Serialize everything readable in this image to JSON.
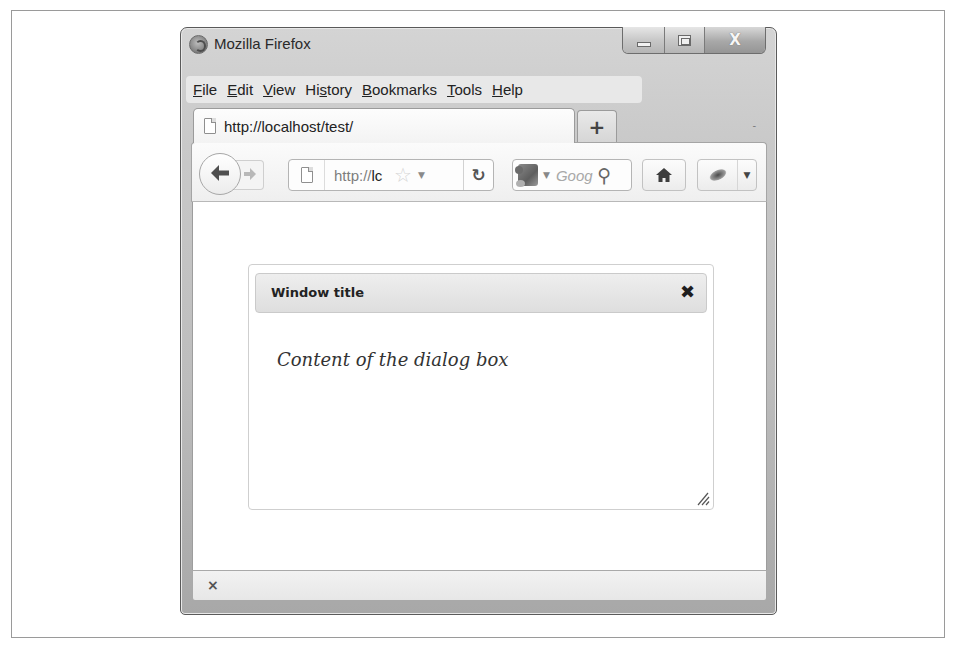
{
  "window": {
    "title": "Mozilla Firefox",
    "controls": {
      "minimize": "minimize",
      "maximize": "maximize",
      "close": "X"
    }
  },
  "menubar": {
    "items": [
      {
        "label": "File",
        "accesskey_index": 0
      },
      {
        "label": "Edit",
        "accesskey_index": 0
      },
      {
        "label": "View",
        "accesskey_index": 0
      },
      {
        "label": "History",
        "accesskey_index": 2
      },
      {
        "label": "Bookmarks",
        "accesskey_index": 0
      },
      {
        "label": "Tools",
        "accesskey_index": 0
      },
      {
        "label": "Help",
        "accesskey_index": 0
      }
    ]
  },
  "tabs": {
    "active": {
      "label": "http://localhost/test/",
      "icon": "page-icon"
    },
    "new_tab_label": "+",
    "list_all_tabs": "-"
  },
  "navbar": {
    "back_glyph": "🡄",
    "forward_glyph": "➜",
    "url": {
      "scheme_part": "http://",
      "host_part": "lc"
    },
    "star_glyph": "☆",
    "dropmarker_glyph": "▼",
    "reload_glyph": "↻",
    "search": {
      "placeholder": "Goog",
      "go_glyph": "⚲",
      "engine_drop": "▼"
    },
    "home_icon": "home-icon",
    "addon_drop": "▼"
  },
  "page": {
    "dialog": {
      "title": "Window title",
      "close_glyph": "✖",
      "content": "Content of the dialog box"
    }
  },
  "statusbar": {
    "close_glyph": "×"
  },
  "colors": {
    "chrome": "#c8c8c8",
    "dialog_titlebar": "#e4e4e4",
    "dialog_border": "#cfcfcf",
    "text": "#222222"
  }
}
